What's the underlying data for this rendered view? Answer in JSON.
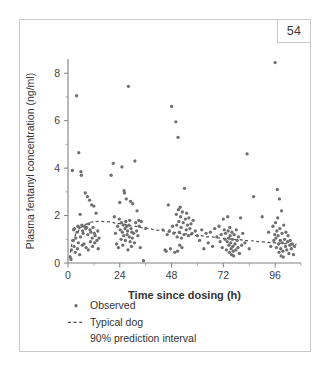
{
  "page": {
    "number": "54"
  },
  "chart_data": {
    "type": "scatter",
    "title": "",
    "xlabel": "Time since dosing (h)",
    "ylabel": "Plasma fentanyl concentration (ng/ml)",
    "xlim": [
      0,
      108
    ],
    "ylim": [
      0,
      8.6
    ],
    "xticks": [
      0,
      24,
      48,
      72,
      96
    ],
    "xticklabels": [
      "0",
      "24",
      "48",
      "72",
      "96"
    ],
    "xminorticks": [
      12,
      36,
      60,
      84,
      108
    ],
    "yticks": [
      0,
      2,
      4,
      6,
      8
    ],
    "yticklabels": [
      "0",
      "2",
      "4",
      "6",
      "8"
    ],
    "yminorticks": [
      1,
      3,
      5,
      7
    ],
    "grid": false,
    "legend_position": "below-axis-left",
    "marker_color": "#6f6f6f",
    "line_color": "#4a4a4a",
    "axis_color": "#808080",
    "frame_color": "#c9c9c9",
    "legend": [
      {
        "label": "Observed",
        "symbol": "dot"
      },
      {
        "label": "Typical dog",
        "symbol": "dashed-line"
      },
      {
        "label": "90% prediction interval",
        "symbol": "none"
      }
    ],
    "series": [
      {
        "name": "Observed",
        "marker": "dot",
        "points": [
          [
            1.0,
            0.25
          ],
          [
            1.4,
            0.15
          ],
          [
            1.6,
            0.55
          ],
          [
            2.0,
            3.9
          ],
          [
            2.2,
            0.95
          ],
          [
            2.6,
            1.4
          ],
          [
            2.8,
            0.7
          ],
          [
            3.0,
            1.45
          ],
          [
            3.4,
            0.45
          ],
          [
            3.6,
            1.05
          ],
          [
            4.0,
            7.05
          ],
          [
            4.2,
            1.3
          ],
          [
            4.4,
            0.6
          ],
          [
            4.6,
            1.55
          ],
          [
            4.8,
            0.85
          ],
          [
            5.0,
            4.65
          ],
          [
            5.2,
            1.5
          ],
          [
            5.4,
            0.35
          ],
          [
            5.6,
            2.05
          ],
          [
            5.8,
            1.1
          ],
          [
            6.0,
            3.85
          ],
          [
            6.2,
            3.7
          ],
          [
            6.4,
            1.6
          ],
          [
            6.6,
            0.75
          ],
          [
            6.8,
            1.35
          ],
          [
            7.0,
            1.25
          ],
          [
            7.4,
            0.8
          ],
          [
            7.6,
            1.55
          ],
          [
            8.0,
            2.95
          ],
          [
            8.2,
            1.45
          ],
          [
            8.4,
            0.65
          ],
          [
            8.6,
            1.5
          ],
          [
            9.0,
            2.8
          ],
          [
            9.2,
            1.2
          ],
          [
            9.4,
            0.55
          ],
          [
            9.6,
            1.65
          ],
          [
            10.0,
            2.65
          ],
          [
            10.2,
            1.4
          ],
          [
            10.4,
            0.9
          ],
          [
            10.6,
            1.3
          ],
          [
            11.0,
            2.45
          ],
          [
            11.2,
            1.05
          ],
          [
            11.4,
            0.7
          ],
          [
            11.6,
            1.5
          ],
          [
            12.0,
            2.4
          ],
          [
            12.2,
            1.25
          ],
          [
            12.4,
            0.85
          ],
          [
            12.6,
            1.15
          ],
          [
            13.0,
            2.1
          ],
          [
            13.4,
            0.95
          ],
          [
            13.8,
            1.35
          ],
          [
            14.0,
            0.6
          ],
          [
            14.4,
            1.05
          ],
          [
            20.0,
            3.7
          ],
          [
            21.0,
            4.2
          ],
          [
            21.5,
            1.95
          ],
          [
            22.0,
            1.25
          ],
          [
            22.5,
            0.8
          ],
          [
            23.0,
            1.55
          ],
          [
            23.4,
            0.65
          ],
          [
            23.8,
            1.85
          ],
          [
            24.0,
            2.55
          ],
          [
            24.2,
            1.4
          ],
          [
            24.6,
            1.0
          ],
          [
            24.8,
            1.7
          ],
          [
            25.0,
            4.05
          ],
          [
            25.2,
            1.3
          ],
          [
            25.4,
            0.75
          ],
          [
            25.6,
            1.6
          ],
          [
            25.8,
            1.15
          ],
          [
            26.0,
            3.05
          ],
          [
            26.2,
            2.95
          ],
          [
            26.4,
            1.45
          ],
          [
            26.6,
            0.95
          ],
          [
            26.8,
            1.75
          ],
          [
            27.0,
            2.7
          ],
          [
            27.2,
            1.55
          ],
          [
            27.4,
            1.2
          ],
          [
            27.6,
            1.35
          ],
          [
            27.8,
            0.55
          ],
          [
            28.0,
            7.45
          ],
          [
            28.2,
            1.6
          ],
          [
            28.4,
            1.1
          ],
          [
            28.6,
            1.8
          ],
          [
            28.8,
            0.9
          ],
          [
            29.0,
            2.6
          ],
          [
            29.2,
            1.45
          ],
          [
            29.4,
            0.7
          ],
          [
            29.6,
            1.3
          ],
          [
            29.8,
            1.05
          ],
          [
            30.0,
            2.5
          ],
          [
            30.4,
            1.25
          ],
          [
            30.8,
            0.85
          ],
          [
            31.0,
            4.3
          ],
          [
            31.4,
            1.7
          ],
          [
            31.8,
            1.35
          ],
          [
            32.0,
            2.2
          ],
          [
            32.4,
            1.15
          ],
          [
            32.8,
            1.8
          ],
          [
            33.0,
            1.55
          ],
          [
            33.5,
            0.65
          ],
          [
            34.0,
            1.75
          ],
          [
            35.0,
            0.1
          ],
          [
            36.0,
            1.45
          ],
          [
            44.0,
            1.4
          ],
          [
            45.0,
            0.55
          ],
          [
            45.5,
            0.5
          ],
          [
            46.0,
            1.2
          ],
          [
            46.5,
            2.45
          ],
          [
            47.0,
            1.35
          ],
          [
            47.5,
            0.6
          ],
          [
            48.0,
            6.6
          ],
          [
            48.5,
            1.55
          ],
          [
            49.0,
            1.25
          ],
          [
            49.5,
            0.45
          ],
          [
            50.0,
            5.95
          ],
          [
            50.2,
            2.05
          ],
          [
            50.4,
            1.6
          ],
          [
            50.6,
            1.1
          ],
          [
            50.8,
            0.5
          ],
          [
            51.0,
            5.3
          ],
          [
            51.2,
            2.25
          ],
          [
            51.4,
            1.75
          ],
          [
            51.6,
            1.3
          ],
          [
            51.8,
            0.75
          ],
          [
            52.0,
            2.35
          ],
          [
            52.2,
            1.95
          ],
          [
            52.4,
            1.5
          ],
          [
            52.6,
            1.05
          ],
          [
            52.8,
            0.65
          ],
          [
            53.0,
            2.15
          ],
          [
            53.4,
            1.7
          ],
          [
            53.8,
            1.2
          ],
          [
            54.0,
            3.15
          ],
          [
            54.4,
            1.85
          ],
          [
            54.8,
            1.4
          ],
          [
            55.0,
            2.1
          ],
          [
            55.4,
            1.6
          ],
          [
            55.8,
            1.15
          ],
          [
            56.0,
            1.9
          ],
          [
            56.5,
            1.45
          ],
          [
            57.0,
            1.65
          ],
          [
            57.5,
            1.25
          ],
          [
            58.0,
            1.8
          ],
          [
            59.0,
            1.35
          ],
          [
            60.0,
            1.15
          ],
          [
            61.0,
            0.95
          ],
          [
            62.0,
            1.4
          ],
          [
            63.0,
            0.6
          ],
          [
            64.0,
            1.25
          ],
          [
            65.0,
            0.85
          ],
          [
            66.0,
            1.3
          ],
          [
            67.0,
            0.7
          ],
          [
            68.0,
            1.45
          ],
          [
            69.0,
            1.1
          ],
          [
            70.0,
            1.55
          ],
          [
            70.5,
            0.9
          ],
          [
            71.0,
            1.2
          ],
          [
            71.5,
            0.65
          ],
          [
            72.0,
            1.85
          ],
          [
            72.4,
            1.4
          ],
          [
            72.8,
            1.0
          ],
          [
            73.0,
            1.25
          ],
          [
            73.4,
            0.55
          ],
          [
            73.8,
            0.9
          ],
          [
            74.0,
            1.95
          ],
          [
            74.2,
            1.35
          ],
          [
            74.4,
            1.05
          ],
          [
            74.6,
            0.75
          ],
          [
            74.8,
            0.45
          ],
          [
            75.0,
            1.5
          ],
          [
            75.2,
            1.15
          ],
          [
            75.4,
            0.85
          ],
          [
            75.6,
            0.6
          ],
          [
            75.8,
            0.35
          ],
          [
            76.0,
            1.3
          ],
          [
            76.2,
            1.0
          ],
          [
            76.4,
            0.7
          ],
          [
            76.6,
            0.5
          ],
          [
            76.8,
            0.3
          ],
          [
            77.0,
            1.2
          ],
          [
            77.4,
            0.8
          ],
          [
            77.8,
            0.55
          ],
          [
            78.0,
            1.4
          ],
          [
            78.4,
            0.95
          ],
          [
            78.8,
            0.65
          ],
          [
            79.0,
            1.1
          ],
          [
            79.5,
            0.4
          ],
          [
            80.0,
            1.9
          ],
          [
            80.5,
            0.75
          ],
          [
            81.0,
            1.25
          ],
          [
            82.0,
            0.85
          ],
          [
            83.0,
            4.6
          ],
          [
            84.0,
            0.6
          ],
          [
            86.0,
            2.8
          ],
          [
            90.0,
            1.95
          ],
          [
            93.0,
            1.3
          ],
          [
            94.0,
            0.7
          ],
          [
            95.0,
            1.55
          ],
          [
            95.4,
            0.95
          ],
          [
            95.8,
            1.2
          ],
          [
            96.0,
            8.45
          ],
          [
            96.2,
            1.7
          ],
          [
            96.4,
            1.05
          ],
          [
            96.6,
            0.65
          ],
          [
            96.8,
            1.35
          ],
          [
            97.0,
            3.1
          ],
          [
            97.2,
            1.9
          ],
          [
            97.4,
            1.15
          ],
          [
            97.6,
            0.8
          ],
          [
            97.8,
            0.45
          ],
          [
            98.0,
            2.7
          ],
          [
            98.2,
            1.45
          ],
          [
            98.4,
            0.95
          ],
          [
            98.6,
            0.6
          ],
          [
            98.8,
            0.3
          ],
          [
            99.0,
            2.2
          ],
          [
            99.2,
            1.25
          ],
          [
            99.4,
            0.85
          ],
          [
            99.6,
            0.5
          ],
          [
            99.8,
            0.25
          ],
          [
            100.0,
            1.6
          ],
          [
            100.4,
            1.0
          ],
          [
            100.8,
            0.7
          ],
          [
            101.0,
            1.3
          ],
          [
            101.4,
            0.55
          ],
          [
            101.8,
            0.9
          ],
          [
            102.0,
            1.15
          ],
          [
            102.4,
            0.4
          ],
          [
            102.8,
            0.75
          ],
          [
            103.0,
            0.95
          ],
          [
            103.5,
            0.6
          ],
          [
            104.0,
            0.8
          ],
          [
            104.5,
            0.35
          ],
          [
            105.0,
            0.7
          ]
        ]
      }
    ],
    "trend": {
      "name": "Typical dog",
      "style": "dashed",
      "points": [
        [
          0.5,
          0.22
        ],
        [
          2.0,
          0.8
        ],
        [
          4.0,
          1.25
        ],
        [
          6.0,
          1.5
        ],
        [
          8.0,
          1.63
        ],
        [
          11.0,
          1.73
        ],
        [
          14.0,
          1.76
        ],
        [
          18.0,
          1.74
        ],
        [
          24.0,
          1.66
        ],
        [
          30.0,
          1.56
        ],
        [
          36.0,
          1.47
        ],
        [
          42.0,
          1.38
        ],
        [
          48.0,
          1.3
        ],
        [
          54.0,
          1.23
        ],
        [
          60.0,
          1.16
        ],
        [
          66.0,
          1.1
        ],
        [
          72.0,
          1.04
        ],
        [
          78.0,
          0.99
        ],
        [
          84.0,
          0.94
        ],
        [
          90.0,
          0.89
        ],
        [
          96.0,
          0.85
        ],
        [
          102.0,
          0.81
        ],
        [
          106.0,
          0.79
        ]
      ]
    }
  }
}
